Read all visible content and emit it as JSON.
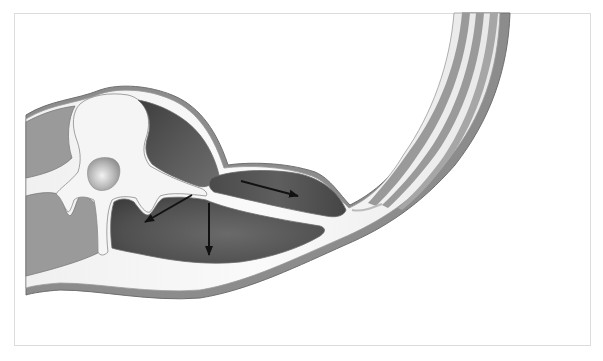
{
  "figure": {
    "arrows": [
      {
        "name": "arrow-down-left",
        "direction": "down-left"
      },
      {
        "name": "arrow-down",
        "direction": "down"
      },
      {
        "name": "arrow-right",
        "direction": "right"
      }
    ],
    "colors": {
      "background": "#ffffff",
      "frame_border": "#dcdcdc",
      "bone": "#f4f4f4",
      "fascia": "#ececec",
      "outline": "#7a7a7a",
      "muscle_light": "#9a9a9a",
      "muscle_dark": "#5a5a5a",
      "muscle_darker": "#4a4a4a",
      "skin": "#8c8c8c",
      "arrow": "#111111"
    }
  }
}
